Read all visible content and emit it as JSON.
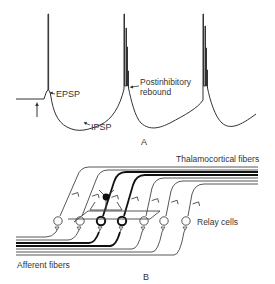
{
  "panel_a": {
    "label": "A",
    "annotations": {
      "epsp": "EPSP",
      "ipsp": "IPSP",
      "rebound_line1": "Postinhibitory",
      "rebound_line2": "rebound"
    }
  },
  "panel_b": {
    "label": "B",
    "labels": {
      "thalamocortical": "Thalamocortical fibers",
      "relay_cells": "Relay cells",
      "afferent": "Afferent fibers"
    },
    "relay_cell_count": 7,
    "interneuron_count": 1,
    "highlighted_relay_cells": 2
  },
  "colors": {
    "ink": "#333333",
    "background": "#ffffff"
  }
}
